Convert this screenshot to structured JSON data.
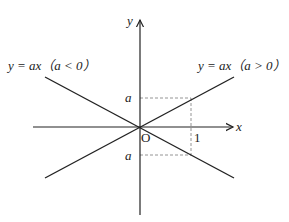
{
  "labels": {
    "y_axis": "y",
    "x_axis": "x",
    "origin": "O",
    "one": "1",
    "a_upper": "a",
    "a_lower": "a",
    "line_neg": "y = ax（a < 0）",
    "line_pos": "y = ax（a > 0）"
  },
  "colors": {
    "line": "#222222",
    "dash": "#888888"
  }
}
